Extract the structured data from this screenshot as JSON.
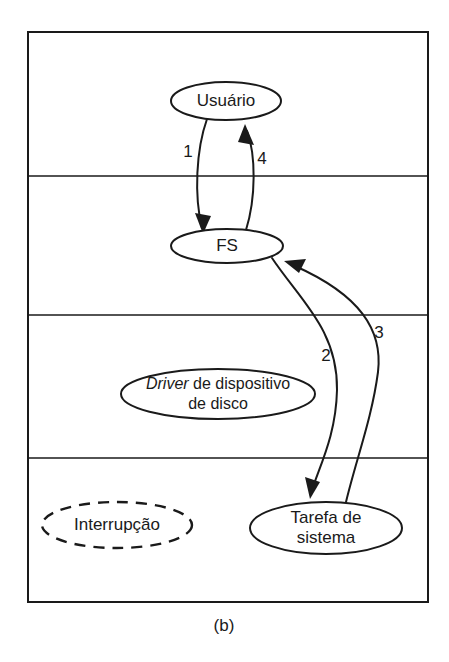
{
  "figure": {
    "caption": "(b)",
    "background_color": "#ffffff",
    "ink_color": "#1a1a1a"
  },
  "frame": {
    "name": "layer-frame",
    "x": 28,
    "y": 32,
    "width": 400,
    "height": 570,
    "stroke_width": 2,
    "divider_y": [
      176,
      315,
      458
    ],
    "divider_stroke_width": 1.6
  },
  "nodes": [
    {
      "id": "usuario",
      "label": "Usuário",
      "style": "solid",
      "cx": 226,
      "cy": 101,
      "rx": 55,
      "ry": 19,
      "lines": [
        {
          "text": "Usuário",
          "italic": false,
          "dy": 0
        }
      ]
    },
    {
      "id": "fs",
      "label": "FS",
      "style": "solid",
      "cx": 227,
      "cy": 246,
      "rx": 56,
      "ry": 17,
      "lines": [
        {
          "text": "FS",
          "italic": false,
          "dy": 0
        }
      ]
    },
    {
      "id": "driver-dispositivo-disco",
      "label": "Driver de dispositivo de disco",
      "style": "solid",
      "cx": 218,
      "cy": 394,
      "rx": 97,
      "ry": 25,
      "lines": [
        {
          "text": "Driver",
          "italic": true,
          "dy": -10,
          "suffix": " de dispositivo"
        },
        {
          "text": "de disco",
          "italic": false,
          "dy": 10
        }
      ]
    },
    {
      "id": "interrupcao",
      "label": "Interrupção",
      "style": "dashed",
      "cx": 117,
      "cy": 525,
      "rx": 75,
      "ry": 23,
      "lines": [
        {
          "text": "Interrupção",
          "italic": false,
          "dy": 0
        }
      ]
    },
    {
      "id": "tarefa-sistema",
      "label": "Tarefa de sistema",
      "style": "solid",
      "cx": 326,
      "cy": 528,
      "rx": 76,
      "ry": 26,
      "lines": [
        {
          "text": "Tarefa de",
          "italic": false,
          "dy": -10
        },
        {
          "text": "sistema",
          "italic": false,
          "dy": 10
        }
      ]
    }
  ],
  "edges": [
    {
      "id": "edge-1",
      "label": "1",
      "from": "usuario",
      "to": "fs",
      "label_x": 188,
      "label_y": 153,
      "direction": "down"
    },
    {
      "id": "edge-4",
      "label": "4",
      "from": "fs",
      "to": "usuario",
      "label_x": 262,
      "label_y": 160,
      "direction": "up"
    },
    {
      "id": "edge-2",
      "label": "2",
      "from": "fs",
      "to": "tarefa-sistema",
      "label_x": 326,
      "label_y": 357,
      "direction": "down"
    },
    {
      "id": "edge-3",
      "label": "3",
      "from": "tarefa-sistema",
      "to": "fs",
      "label_x": 379,
      "label_y": 334,
      "direction": "up"
    }
  ]
}
